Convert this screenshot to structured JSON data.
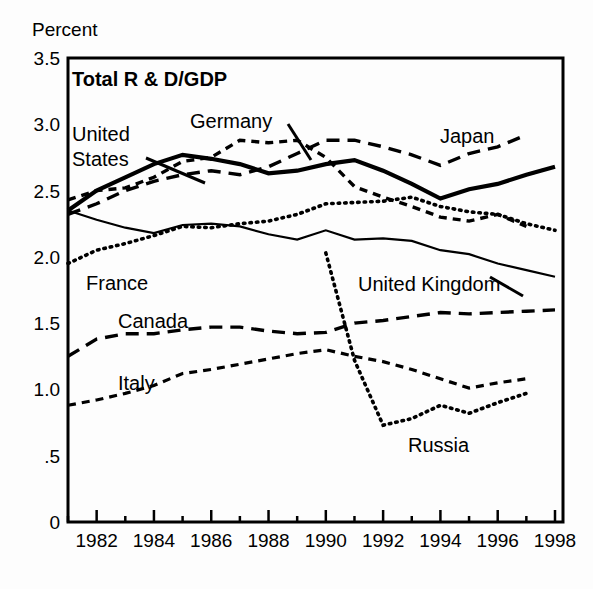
{
  "chart_data": {
    "type": "line",
    "title": "Total R & D/GDP",
    "ylabel": "Percent",
    "xlabel": "",
    "xlim": [
      1981,
      1998
    ],
    "ylim": [
      0,
      3.5
    ],
    "grid": false,
    "legend": "inline-annotations",
    "y_ticks": [
      "0",
      ".5",
      "1.0",
      "1.5",
      "2.0",
      "2.5",
      "3.0",
      "3.5"
    ],
    "y_tick_values": [
      0,
      0.5,
      1.0,
      1.5,
      2.0,
      2.5,
      3.0,
      3.5
    ],
    "x_ticks": [
      "1982",
      "1984",
      "1986",
      "1988",
      "1990",
      "1992",
      "1994",
      "1996",
      "1998"
    ],
    "x_tick_values": [
      1982,
      1984,
      1986,
      1988,
      1990,
      1992,
      1994,
      1996,
      1998
    ],
    "x_minor_values": [
      1981,
      1983,
      1985,
      1987,
      1989,
      1991,
      1993,
      1995,
      1997
    ],
    "series": [
      {
        "name": "United States",
        "style": "solid-thick",
        "width": 4.2,
        "dash": "none",
        "x": [
          1981,
          1982,
          1983,
          1984,
          1985,
          1986,
          1987,
          1988,
          1989,
          1990,
          1991,
          1992,
          1993,
          1994,
          1995,
          1996,
          1997,
          1998
        ],
        "values": [
          2.35,
          2.5,
          2.6,
          2.7,
          2.77,
          2.74,
          2.7,
          2.63,
          2.65,
          2.7,
          2.73,
          2.65,
          2.55,
          2.44,
          2.51,
          2.55,
          2.62,
          2.68
        ]
      },
      {
        "name": "Japan",
        "style": "dashed-long",
        "width": 3.4,
        "dash": "13,8",
        "x": [
          1981,
          1982,
          1983,
          1984,
          1985,
          1986,
          1987,
          1988,
          1989,
          1990,
          1991,
          1992,
          1993,
          1994,
          1995,
          1996,
          1997,
          1998
        ],
        "values": [
          2.32,
          2.4,
          2.5,
          2.57,
          2.62,
          2.65,
          2.62,
          2.68,
          2.78,
          2.88,
          2.88,
          2.83,
          2.77,
          2.69,
          2.78,
          2.83,
          2.92,
          null
        ]
      },
      {
        "name": "Germany",
        "style": "dashed-short",
        "width": 3.4,
        "dash": "8,6",
        "x": [
          1981,
          1982,
          1983,
          1984,
          1985,
          1986,
          1987,
          1988,
          1989,
          1990,
          1991,
          1992,
          1993,
          1994,
          1995,
          1996,
          1997
        ],
        "values": [
          2.43,
          2.5,
          2.52,
          2.6,
          2.72,
          2.75,
          2.88,
          2.86,
          2.88,
          2.75,
          2.53,
          2.45,
          2.38,
          2.3,
          2.27,
          2.32,
          2.23
        ]
      },
      {
        "name": "France",
        "style": "dotted",
        "width": 3.6,
        "dash": "1.5,5",
        "x": [
          1981,
          1982,
          1983,
          1984,
          1985,
          1986,
          1987,
          1988,
          1989,
          1990,
          1991,
          1992,
          1993,
          1994,
          1995,
          1996,
          1997,
          1998
        ],
        "values": [
          1.95,
          2.05,
          2.1,
          2.16,
          2.23,
          2.22,
          2.25,
          2.27,
          2.32,
          2.4,
          2.41,
          2.42,
          2.45,
          2.38,
          2.34,
          2.32,
          2.25,
          2.2
        ]
      },
      {
        "name": "United Kingdom",
        "style": "solid-thin",
        "width": 2.2,
        "dash": "none",
        "x": [
          1981,
          1982,
          1983,
          1984,
          1985,
          1986,
          1987,
          1988,
          1989,
          1990,
          1991,
          1992,
          1993,
          1994,
          1995,
          1996,
          1997,
          1998
        ],
        "values": [
          2.35,
          2.28,
          2.22,
          2.18,
          2.24,
          2.25,
          2.23,
          2.17,
          2.13,
          2.2,
          2.13,
          2.14,
          2.12,
          2.05,
          2.02,
          1.95,
          1.9,
          1.85
        ]
      },
      {
        "name": "Canada",
        "style": "dashed-long",
        "width": 3.4,
        "dash": "13,8",
        "x": [
          1981,
          1982,
          1983,
          1984,
          1985,
          1986,
          1987,
          1988,
          1989,
          1990,
          1991,
          1992,
          1993,
          1994,
          1995,
          1996,
          1997,
          1998
        ],
        "values": [
          1.25,
          1.38,
          1.42,
          1.42,
          1.45,
          1.47,
          1.47,
          1.44,
          1.42,
          1.43,
          1.5,
          1.52,
          1.55,
          1.58,
          1.57,
          1.58,
          1.59,
          1.6
        ]
      },
      {
        "name": "Italy",
        "style": "dashed-short",
        "width": 3.2,
        "dash": "8,6",
        "x": [
          1981,
          1982,
          1983,
          1984,
          1985,
          1986,
          1987,
          1988,
          1989,
          1990,
          1991,
          1992,
          1993,
          1994,
          1995,
          1996,
          1997,
          1998
        ],
        "values": [
          0.88,
          0.92,
          0.97,
          1.03,
          1.12,
          1.15,
          1.19,
          1.23,
          1.27,
          1.3,
          1.25,
          1.21,
          1.15,
          1.08,
          1.01,
          1.05,
          1.08,
          null
        ]
      },
      {
        "name": "Russia",
        "style": "dotted",
        "width": 3.6,
        "dash": "1.5,5",
        "x": [
          1990,
          1991,
          1992,
          1993,
          1994,
          1995,
          1996,
          1997
        ],
        "values": [
          2.03,
          1.22,
          0.73,
          0.78,
          0.88,
          0.82,
          0.9,
          0.97
        ]
      }
    ],
    "annotations": [
      {
        "text": "Total R & D/GDP",
        "x": 72,
        "y": 86,
        "bold": true,
        "anchor": "start"
      },
      {
        "text": "Percent",
        "x": 32,
        "y": 36,
        "bold": false,
        "anchor": "start"
      },
      {
        "text": "United",
        "x": 72,
        "y": 141,
        "bold": false,
        "anchor": "start"
      },
      {
        "text": "States",
        "x": 72,
        "y": 166,
        "bold": false,
        "anchor": "start"
      },
      {
        "text": "Germany",
        "x": 190,
        "y": 128,
        "bold": false,
        "anchor": "start"
      },
      {
        "text": "Japan",
        "x": 440,
        "y": 143,
        "bold": false,
        "anchor": "start"
      },
      {
        "text": "France",
        "x": 86,
        "y": 290,
        "bold": false,
        "anchor": "start"
      },
      {
        "text": "United Kingdom",
        "x": 358,
        "y": 291,
        "bold": false,
        "anchor": "start"
      },
      {
        "text": "Canada",
        "x": 118,
        "y": 328,
        "bold": false,
        "anchor": "start"
      },
      {
        "text": "Italy",
        "x": 118,
        "y": 390,
        "bold": false,
        "anchor": "start"
      },
      {
        "text": "Russia",
        "x": 408,
        "y": 452,
        "bold": false,
        "anchor": "start"
      }
    ],
    "leaders": [
      {
        "name": "united-states-leader",
        "x1": 146,
        "y1": 158,
        "x2": 205,
        "y2": 183
      },
      {
        "name": "germany-leader",
        "x1": 288,
        "y1": 124,
        "x2": 311,
        "y2": 160
      },
      {
        "name": "united-kingdom-leader",
        "x1": 490,
        "y1": 277,
        "x2": 523,
        "y2": 296
      }
    ],
    "colors": {
      "line": "#000000",
      "axis": "#000000",
      "background": "#ffffff"
    }
  },
  "geometry": {
    "plot": {
      "left": 68,
      "right": 563,
      "top": 58,
      "bottom": 522
    },
    "x_start_year": 1981,
    "x_end_year": 1998,
    "y_min": 0,
    "y_max": 3.5
  }
}
